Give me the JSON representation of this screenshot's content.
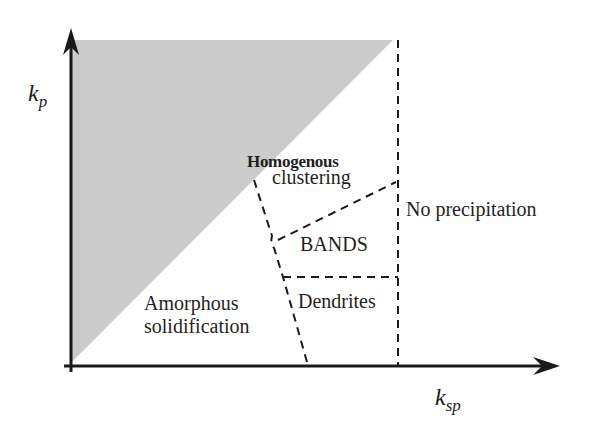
{
  "diagram": {
    "type": "phase-diagram",
    "axes": {
      "x": {
        "symbol": "k",
        "subscript": "sp"
      },
      "y": {
        "symbol": "k",
        "subscript": "p"
      }
    },
    "regions": {
      "homogenous_line1": "Homogenous",
      "homogenous_line2": "clustering",
      "no_precipitation": "No precipitation",
      "bands": "BANDS",
      "amorphous_line1": "Amorphous",
      "amorphous_line2": "solidification",
      "dendrites": "Dendrites"
    },
    "colors": {
      "shaded_region": "#c8c8c8",
      "axis": "#1a1a1a",
      "dashed": "#1a1a1a"
    }
  }
}
